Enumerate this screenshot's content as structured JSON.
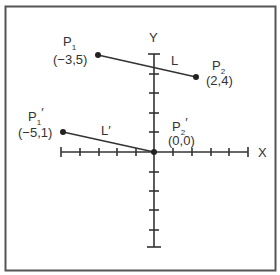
{
  "diagram": {
    "type": "coordinate-plane-translation",
    "axes": {
      "x_label": "X",
      "y_label": "Y",
      "x_ticks_negative": 5,
      "x_ticks_positive": 5,
      "y_ticks_positive": 5,
      "y_ticks_negative": 5
    },
    "lines": [
      {
        "name": "L",
        "label": "L",
        "from": "P1",
        "to": "P2"
      },
      {
        "name": "L_prime",
        "label": "L′",
        "from": "P1_prime",
        "to": "P2_prime"
      }
    ],
    "points": {
      "P1": {
        "label": "P",
        "subscript": "1",
        "prime": "",
        "coords_text": "(−3,5)",
        "x": -3,
        "y": 5
      },
      "P2": {
        "label": "P",
        "subscript": "2",
        "prime": "",
        "coords_text": "(2,4)",
        "x": 2,
        "y": 4
      },
      "P1_prime": {
        "label": "P",
        "subscript": "1",
        "prime": "′",
        "coords_text": "(−5,1)",
        "x": -5,
        "y": 1
      },
      "P2_prime": {
        "label": "P",
        "subscript": "2",
        "prime": "′",
        "coords_text": "(0,0)",
        "x": 0,
        "y": 0
      }
    },
    "colors": {
      "ink": "#333333",
      "border": "#555555",
      "background": "#ffffff"
    }
  }
}
